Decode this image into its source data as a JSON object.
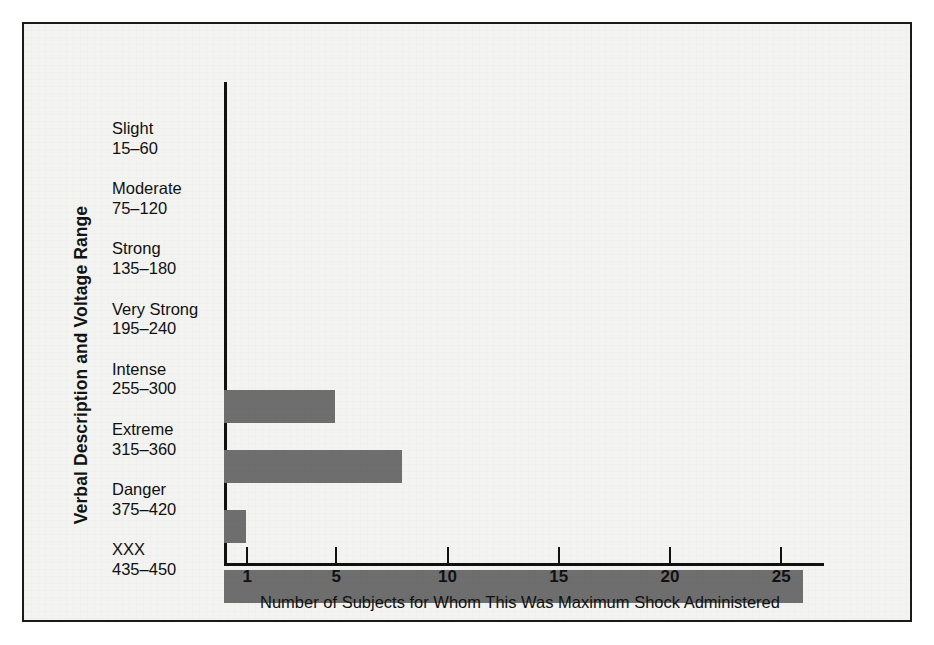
{
  "figure": {
    "background_color": "#f3f3f1",
    "frame_color": "#1a1a1a",
    "bar_color": "#6e6e6e",
    "axis_color": "#111111"
  },
  "chart_data": {
    "type": "bar",
    "orientation": "horizontal",
    "title": "",
    "xlabel": "Number of Subjects for Whom This Was Maximum Shock Administered",
    "ylabel": "Verbal Description and Voltage Range",
    "categories": [
      "Slight 15–60",
      "Moderate 75–120",
      "Strong 135–180",
      "Very Strong 195–240",
      "Intense 255–300",
      "Extreme 315–360",
      "Danger 375–420",
      "XXX 435–450"
    ],
    "category_details": [
      {
        "name": "Slight",
        "range": "15–60",
        "value": 0
      },
      {
        "name": "Moderate",
        "range": "75–120",
        "value": 0
      },
      {
        "name": "Strong",
        "range": "135–180",
        "value": 0
      },
      {
        "name": "Very Strong",
        "range": "195–240",
        "value": 0
      },
      {
        "name": "Intense",
        "range": "255–300",
        "value": 5
      },
      {
        "name": "Extreme",
        "range": "315–360",
        "value": 8
      },
      {
        "name": "Danger",
        "range": "375–420",
        "value": 1
      },
      {
        "name": "XXX",
        "range": "435–450",
        "value": 26
      }
    ],
    "values": [
      0,
      0,
      0,
      0,
      5,
      8,
      1,
      26
    ],
    "xticks": [
      1,
      5,
      10,
      15,
      20,
      25
    ],
    "xtick_labels": [
      "1",
      "5",
      "10",
      "15",
      "20",
      "25"
    ],
    "xlim": [
      0,
      27
    ],
    "grid": false,
    "legend": false
  }
}
